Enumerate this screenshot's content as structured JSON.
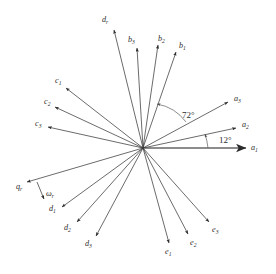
{
  "figure": {
    "type": "vector-phasor-diagram",
    "title": "",
    "background": "#ffffff",
    "line_color": "#3a3a3a",
    "reference_line_color": "#8c8c8c",
    "origin": {
      "x": 143,
      "y": 148
    }
  },
  "angles": [
    {
      "name": "angle-72",
      "label": "72°",
      "value": 72,
      "unit": "deg",
      "x": 182,
      "y": 118,
      "arc": "M 186 122 A 46 46 0 0 0 157 104"
    },
    {
      "name": "angle-12",
      "label": "12°",
      "value": 12,
      "unit": "deg",
      "x": 219,
      "y": 143,
      "arc": "M 208 148 A 66 66 0 0 0 205 134"
    }
  ],
  "vectors": [
    {
      "id": "a1",
      "base": "a",
      "sub": "1",
      "angle_deg": 0,
      "tip": {
        "x": 246,
        "y": 148
      },
      "label_x": 251,
      "label_y": 150,
      "reference": true
    },
    {
      "id": "a2",
      "base": "a",
      "sub": "2",
      "angle_deg": 12,
      "tip": {
        "x": 236,
        "y": 128
      },
      "label_x": 242,
      "label_y": 127,
      "reference": false
    },
    {
      "id": "a3",
      "base": "a",
      "sub": "3",
      "angle_deg": 25,
      "tip": {
        "x": 228,
        "y": 102
      },
      "label_x": 234,
      "label_y": 101,
      "reference": false
    },
    {
      "id": "b1",
      "base": "b",
      "sub": "1",
      "angle_deg": 66,
      "tip": {
        "x": 176,
        "y": 52
      },
      "label_x": 179,
      "label_y": 48,
      "reference": false
    },
    {
      "id": "b2",
      "base": "b",
      "sub": "2",
      "angle_deg": 79,
      "tip": {
        "x": 158,
        "y": 45
      },
      "label_x": 158,
      "label_y": 41,
      "reference": false
    },
    {
      "id": "b3",
      "base": "b",
      "sub": "3",
      "angle_deg": 85,
      "tip": {
        "x": 137,
        "y": 48
      },
      "label_x": 128,
      "label_y": 42,
      "reference": false
    },
    {
      "id": "dr",
      "base": "d",
      "sub": "r",
      "angle_deg": 100,
      "tip": {
        "x": 114,
        "y": 30
      },
      "label_x": 102,
      "label_y": 22,
      "reference": false
    },
    {
      "id": "c1",
      "base": "c",
      "sub": "1",
      "angle_deg": 150,
      "tip": {
        "x": 66,
        "y": 88
      },
      "label_x": 55,
      "label_y": 83,
      "reference": false
    },
    {
      "id": "c2",
      "base": "c",
      "sub": "2",
      "angle_deg": 161,
      "tip": {
        "x": 55,
        "y": 107
      },
      "label_x": 44,
      "label_y": 104,
      "reference": false
    },
    {
      "id": "c3",
      "base": "c",
      "sub": "3",
      "angle_deg": 170,
      "tip": {
        "x": 48,
        "y": 127
      },
      "label_x": 35,
      "label_y": 126,
      "reference": false
    },
    {
      "id": "qr",
      "base": "q",
      "sub": "r",
      "angle_deg": 196,
      "tip": {
        "x": 27,
        "y": 182
      },
      "label_x": 16,
      "label_y": 189,
      "reference": false
    },
    {
      "id": "wr",
      "base": "ω",
      "sub": "r",
      "angle_deg": 0,
      "tip": {
        "x": 44,
        "y": 199
      },
      "label_x": 46,
      "label_y": 196,
      "reference": false,
      "is_omega": true
    },
    {
      "id": "d1",
      "base": "d",
      "sub": "1",
      "angle_deg": 218,
      "tip": {
        "x": 62,
        "y": 207
      },
      "label_x": 49,
      "label_y": 211,
      "reference": false
    },
    {
      "id": "d2",
      "base": "d",
      "sub": "2",
      "angle_deg": 228,
      "tip": {
        "x": 77,
        "y": 222
      },
      "label_x": 64,
      "label_y": 230,
      "reference": false
    },
    {
      "id": "d3",
      "base": "d",
      "sub": "3",
      "angle_deg": 238,
      "tip": {
        "x": 96,
        "y": 236
      },
      "label_x": 85,
      "label_y": 246,
      "reference": false
    },
    {
      "id": "e1",
      "base": "e",
      "sub": "1",
      "angle_deg": 288,
      "tip": {
        "x": 169,
        "y": 243
      },
      "label_x": 165,
      "label_y": 254,
      "reference": false
    },
    {
      "id": "e2",
      "base": "e",
      "sub": "2",
      "angle_deg": 297,
      "tip": {
        "x": 188,
        "y": 234
      },
      "label_x": 190,
      "label_y": 245,
      "reference": false
    },
    {
      "id": "e3",
      "base": "e",
      "sub": "3",
      "angle_deg": 310,
      "tip": {
        "x": 209,
        "y": 222
      },
      "label_x": 212,
      "label_y": 232,
      "reference": false
    }
  ]
}
